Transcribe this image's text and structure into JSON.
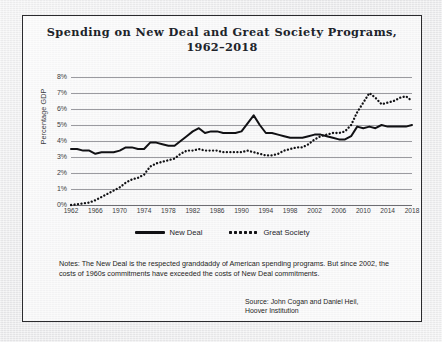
{
  "chart_data": {
    "type": "line",
    "title": "Spending on New Deal and Great Society Programs, 1962–2018",
    "title_line1": "Spending on New Deal and Great Society Programs,",
    "title_line2": "1962–2018",
    "xlabel": "",
    "ylabel": "Percentage GDP",
    "ylim": [
      0,
      8
    ],
    "xlim": [
      1962,
      2018
    ],
    "ytick_labels": [
      "0%",
      "1%",
      "2%",
      "3%",
      "4%",
      "5%",
      "6%",
      "7%",
      "8%"
    ],
    "ytick_values": [
      0,
      1,
      2,
      3,
      4,
      5,
      6,
      7,
      8
    ],
    "xtick_labels": [
      "1962",
      "1966",
      "1970",
      "1974",
      "1978",
      "1982",
      "1986",
      "1990",
      "1994",
      "1998",
      "2002",
      "2006",
      "2010",
      "2014",
      "2018"
    ],
    "xtick_values": [
      1962,
      1966,
      1970,
      1974,
      1978,
      1982,
      1986,
      1990,
      1994,
      1998,
      2002,
      2006,
      2010,
      2014,
      2018
    ],
    "grid": true,
    "legend_position": "bottom",
    "x": [
      1962,
      1963,
      1964,
      1965,
      1966,
      1967,
      1968,
      1969,
      1970,
      1971,
      1972,
      1973,
      1974,
      1975,
      1976,
      1977,
      1978,
      1979,
      1980,
      1981,
      1982,
      1983,
      1984,
      1985,
      1986,
      1987,
      1988,
      1989,
      1990,
      1991,
      1992,
      1993,
      1994,
      1995,
      1996,
      1997,
      1998,
      1999,
      2000,
      2001,
      2002,
      2003,
      2004,
      2005,
      2006,
      2007,
      2008,
      2009,
      2010,
      2011,
      2012,
      2013,
      2014,
      2015,
      2016,
      2017,
      2018
    ],
    "series": [
      {
        "name": "New Deal",
        "style": "solid",
        "color": "#111114",
        "values": [
          3.5,
          3.5,
          3.4,
          3.4,
          3.2,
          3.3,
          3.3,
          3.3,
          3.4,
          3.6,
          3.6,
          3.5,
          3.5,
          3.9,
          3.9,
          3.8,
          3.7,
          3.7,
          4.0,
          4.3,
          4.6,
          4.8,
          4.5,
          4.6,
          4.6,
          4.5,
          4.5,
          4.5,
          4.6,
          5.1,
          5.6,
          5.0,
          4.5,
          4.5,
          4.4,
          4.3,
          4.2,
          4.2,
          4.2,
          4.3,
          4.4,
          4.4,
          4.3,
          4.2,
          4.1,
          4.1,
          4.3,
          4.9,
          4.8,
          4.9,
          4.8,
          5.0,
          4.9,
          4.9,
          4.9,
          4.9,
          5.0
        ]
      },
      {
        "name": "Great Society",
        "style": "dotted",
        "color": "#111114",
        "values": [
          0.0,
          0.05,
          0.1,
          0.15,
          0.3,
          0.5,
          0.7,
          0.9,
          1.1,
          1.4,
          1.6,
          1.7,
          1.9,
          2.4,
          2.6,
          2.7,
          2.8,
          2.9,
          3.2,
          3.4,
          3.4,
          3.5,
          3.4,
          3.4,
          3.4,
          3.3,
          3.3,
          3.3,
          3.3,
          3.4,
          3.3,
          3.2,
          3.1,
          3.1,
          3.2,
          3.4,
          3.5,
          3.6,
          3.6,
          3.8,
          4.1,
          4.3,
          4.4,
          4.5,
          4.5,
          4.6,
          5.0,
          5.8,
          6.4,
          7.0,
          6.7,
          6.3,
          6.4,
          6.5,
          6.7,
          6.8,
          6.5
        ]
      }
    ]
  },
  "legend": {
    "items": [
      {
        "label": "New Deal",
        "style": "solid"
      },
      {
        "label": "Great Society",
        "style": "dotted"
      }
    ]
  },
  "notes": {
    "text": "Notes: The New Deal is the respected granddaddy of American spending programs. But since 2002, the costs of 1960s commitments have exceeded the costs of New Deal commitments."
  },
  "source": {
    "line1": "Source: John Cogan and Daniel Heil,",
    "line2": "Hoover Institution"
  }
}
